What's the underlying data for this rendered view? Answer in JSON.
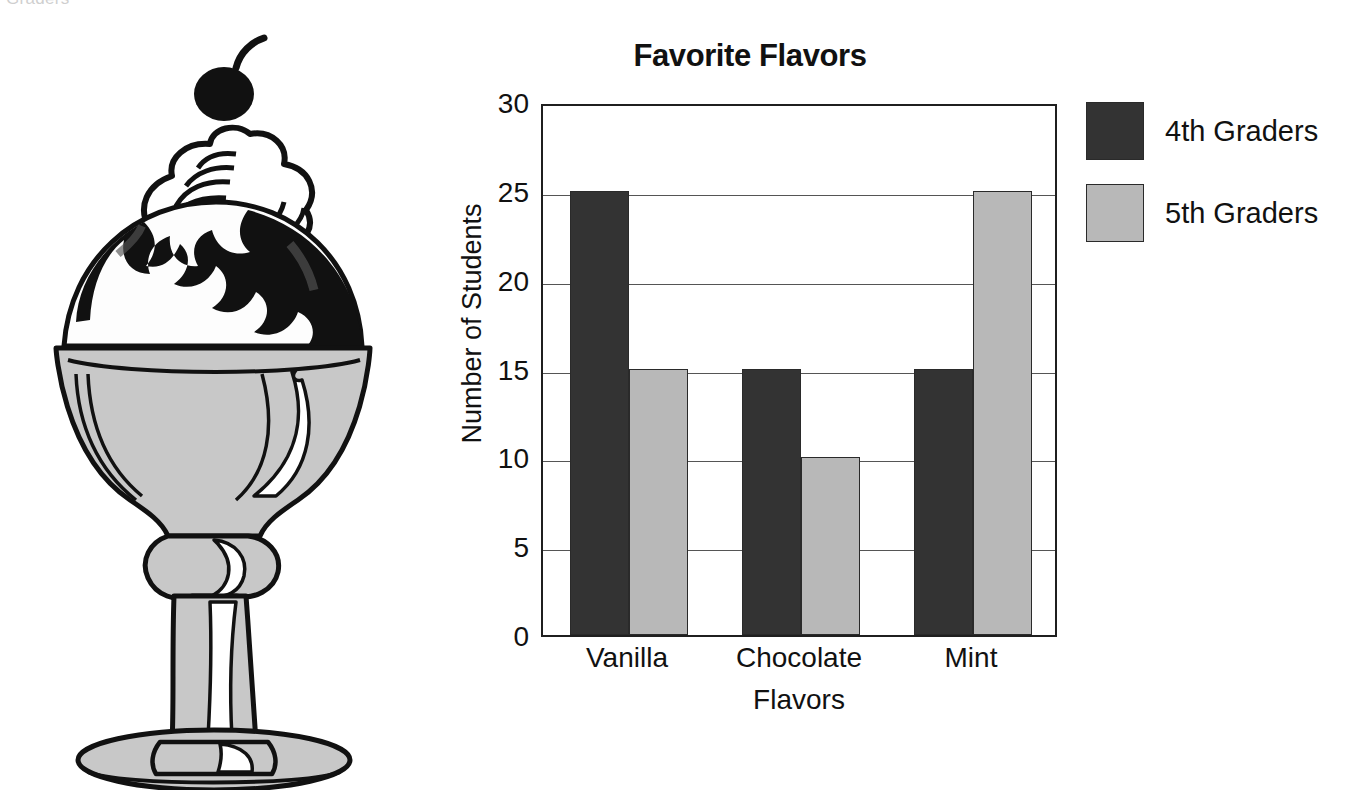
{
  "top_caption": "Graders",
  "illustration": {
    "name": "ice-cream-sundae",
    "glass_color": "#c8c8c8",
    "syrup_color": "#111111",
    "cream_color": "#ffffff"
  },
  "chart_data": {
    "type": "bar",
    "title": "Favorite Flavors",
    "xlabel": "Flavors",
    "ylabel": "Number of Students",
    "categories": [
      "Vanilla",
      "Chocolate",
      "Mint"
    ],
    "series": [
      {
        "name": "4th Graders",
        "color": "#333333",
        "values": [
          25,
          15,
          15
        ]
      },
      {
        "name": "5th Graders",
        "color": "#b8b8b8",
        "values": [
          15,
          10,
          25
        ]
      }
    ],
    "ylim": [
      0,
      30
    ],
    "yticks": [
      30,
      25,
      20,
      15,
      10,
      5,
      0
    ],
    "grid": true,
    "legend_position": "right"
  }
}
